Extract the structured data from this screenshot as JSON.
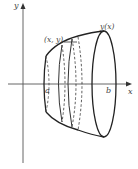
{
  "figure": {
    "axes": {
      "x_label": "x",
      "y_label": "y"
    },
    "labels": {
      "point": "(x, y)",
      "curve": "y(x)",
      "lower_bound": "a",
      "upper_bound": "b"
    },
    "colors": {
      "stroke": "#222222",
      "axis": "#555555",
      "text": "#444444"
    }
  }
}
